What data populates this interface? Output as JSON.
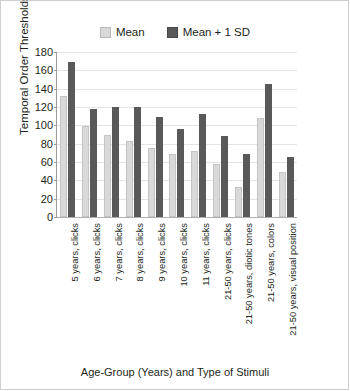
{
  "chart_data": {
    "type": "bar",
    "title": "",
    "xlabel": "Age-Group (Years) and Type of Stimuli",
    "ylabel": "Temporal Order Thresholds (ms)",
    "ylim": [
      0,
      180
    ],
    "yticks": [
      0,
      20,
      40,
      60,
      80,
      100,
      120,
      140,
      160,
      180
    ],
    "ytick_labels": [
      "0",
      "20",
      "40",
      "60",
      "80",
      "100",
      "120",
      "140",
      "160",
      "180"
    ],
    "grid": "horizontal",
    "legend_position": "top-center",
    "categories": [
      "5 years, clicks",
      "6 years, clicks",
      "7 years, clicks",
      "8 years, clicks",
      "9 years, clicks",
      "10 years, clicks",
      "11 years, clicks",
      "21-50 years, clicks",
      "21-50 years, diotic tones",
      "21-50 years, colors",
      "21-50 years, visual position"
    ],
    "series": [
      {
        "name": "Mean",
        "color": "#d9d9d9",
        "values": [
          132,
          99,
          90,
          83,
          75,
          69,
          72,
          58,
          33,
          108,
          49
        ]
      },
      {
        "name": "Mean + 1 SD",
        "color": "#595959",
        "values": [
          169,
          118,
          120,
          120,
          109,
          96,
          112,
          88,
          69,
          145,
          66
        ]
      }
    ]
  },
  "legend": {
    "items": [
      {
        "label": "Mean",
        "swatch": "mean-swatch"
      },
      {
        "label": "Mean + 1 SD",
        "swatch": "sd-swatch"
      }
    ]
  },
  "colors": {
    "mean": "#d9d9d9",
    "mean_plus_sd": "#595959",
    "gridline": "#e3e3e3",
    "axis": "#9a9a9a",
    "text": "#231f20",
    "background": "#ffffff"
  }
}
